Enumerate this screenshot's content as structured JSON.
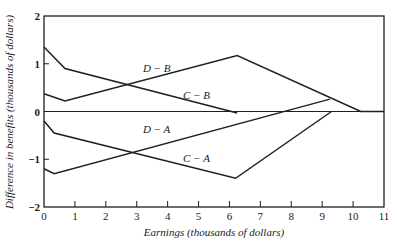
{
  "chart_data": {
    "type": "line",
    "title": "",
    "xlabel": "Earnings (thousands of dollars)",
    "ylabel": "Difference in benefits (thousands of dollars)",
    "xlim": [
      0,
      11
    ],
    "ylim": [
      -2,
      2
    ],
    "xticks": [
      0,
      1,
      2,
      3,
      4,
      5,
      6,
      7,
      8,
      9,
      10,
      11
    ],
    "yticks": [
      -2,
      -1,
      0,
      1,
      2
    ],
    "ytick_labels": [
      "−2",
      "−1",
      "0",
      "1",
      "2"
    ],
    "grid": false,
    "zero_line": true,
    "legend": "inline labels",
    "series": [
      {
        "name": "D − B",
        "label_pos": [
          3.2,
          0.82
        ],
        "points": [
          [
            0,
            0.37
          ],
          [
            0.68,
            0.22
          ],
          [
            6.25,
            1.17
          ],
          [
            10.25,
            0.0
          ],
          [
            11,
            0.0
          ]
        ]
      },
      {
        "name": "C − B",
        "label_pos": [
          4.5,
          0.26
        ],
        "points": [
          [
            0,
            1.35
          ],
          [
            0.68,
            0.9
          ],
          [
            6.25,
            -0.03
          ]
        ]
      },
      {
        "name": "D − A",
        "label_pos": [
          3.2,
          -0.45
        ],
        "points": [
          [
            0,
            -1.2
          ],
          [
            0.33,
            -1.3
          ],
          [
            9.25,
            0.26
          ]
        ]
      },
      {
        "name": "C − A",
        "label_pos": [
          4.5,
          -1.05
        ],
        "points": [
          [
            0,
            -0.2
          ],
          [
            0.33,
            -0.45
          ],
          [
            6.2,
            -1.4
          ],
          [
            9.3,
            0.0
          ]
        ]
      }
    ]
  }
}
